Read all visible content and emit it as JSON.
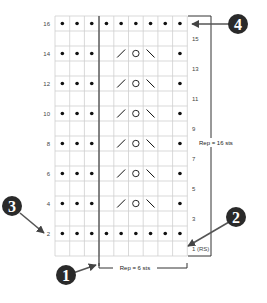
{
  "chart_data": {
    "type": "table",
    "columns": 9,
    "rows": 16,
    "symbols": {
      "dot": "purl",
      "blank": "knit",
      "slash": "k2tog",
      "circle": "yo",
      "backslash": "ssk"
    },
    "grid": [
      {
        "row": 16,
        "cells": [
          "dot",
          "dot",
          "dot",
          "dot",
          "dot",
          "dot",
          "dot",
          "dot",
          "dot"
        ]
      },
      {
        "row": 15,
        "cells": [
          "",
          "",
          "",
          "",
          "",
          "",
          "",
          "",
          ""
        ]
      },
      {
        "row": 14,
        "cells": [
          "dot",
          "dot",
          "dot",
          "",
          "slash",
          "circle",
          "backslash",
          "",
          "dot"
        ]
      },
      {
        "row": 13,
        "cells": [
          "",
          "",
          "",
          "",
          "",
          "",
          "",
          "",
          ""
        ]
      },
      {
        "row": 12,
        "cells": [
          "dot",
          "dot",
          "dot",
          "",
          "slash",
          "circle",
          "backslash",
          "",
          "dot"
        ]
      },
      {
        "row": 11,
        "cells": [
          "",
          "",
          "",
          "",
          "",
          "",
          "",
          "",
          ""
        ]
      },
      {
        "row": 10,
        "cells": [
          "dot",
          "dot",
          "dot",
          "",
          "slash",
          "circle",
          "backslash",
          "",
          "dot"
        ]
      },
      {
        "row": 9,
        "cells": [
          "",
          "",
          "",
          "",
          "",
          "",
          "",
          "",
          ""
        ]
      },
      {
        "row": 8,
        "cells": [
          "dot",
          "dot",
          "dot",
          "",
          "slash",
          "circle",
          "backslash",
          "",
          "dot"
        ]
      },
      {
        "row": 7,
        "cells": [
          "",
          "",
          "",
          "",
          "",
          "",
          "",
          "",
          ""
        ]
      },
      {
        "row": 6,
        "cells": [
          "dot",
          "dot",
          "dot",
          "",
          "slash",
          "circle",
          "backslash",
          "",
          "dot"
        ]
      },
      {
        "row": 5,
        "cells": [
          "",
          "",
          "",
          "",
          "",
          "",
          "",
          "",
          ""
        ]
      },
      {
        "row": 4,
        "cells": [
          "dot",
          "dot",
          "dot",
          "",
          "slash",
          "circle",
          "backslash",
          "",
          "dot"
        ]
      },
      {
        "row": 3,
        "cells": [
          "",
          "",
          "",
          "",
          "",
          "",
          "",
          "",
          ""
        ]
      },
      {
        "row": 2,
        "cells": [
          "dot",
          "dot",
          "dot",
          "dot",
          "dot",
          "dot",
          "dot",
          "dot",
          "dot"
        ]
      },
      {
        "row": 1,
        "cells": [
          "",
          "",
          "",
          "",
          "",
          "",
          "",
          "",
          ""
        ]
      }
    ],
    "left_row_labels": [
      "16",
      "14",
      "12",
      "10",
      "8",
      "6",
      "4",
      "2"
    ],
    "right_row_labels": [
      "15",
      "13",
      "11",
      "9",
      "7",
      "5",
      "3",
      "1 (RS)"
    ],
    "horizontal_repeat_label": "Rep = 6 sts",
    "vertical_repeat_label": "Rep = 16 sts",
    "callouts": [
      {
        "number": "1",
        "points_to": "start of stitch repeat (bottom)"
      },
      {
        "number": "2",
        "points_to": "row 1 (RS), start of chart"
      },
      {
        "number": "3",
        "points_to": "row 2 label (WS rows read left)"
      },
      {
        "number": "4",
        "points_to": "top row 16"
      }
    ]
  },
  "labels": {
    "left": {
      "r16": "16",
      "r14": "14",
      "r12": "12",
      "r10": "10",
      "r8": "8",
      "r6": "6",
      "r4": "4",
      "r2": "2"
    },
    "right": {
      "r15": "15",
      "r13": "13",
      "r11": "11",
      "r9": "9",
      "r7": "7",
      "r5": "5",
      "r3": "3",
      "r1": "1 (RS)"
    },
    "rep_stitches": "Rep = 6 sts",
    "rep_rows": "Rep = 16 sts",
    "callout1": "1",
    "callout2": "2",
    "callout3": "3",
    "callout4": "4"
  },
  "colors": {
    "grid_line": "#cfcfcf",
    "symbol": "#111111",
    "callout_fill": "#2a2a2a",
    "arrow": "#444444"
  }
}
